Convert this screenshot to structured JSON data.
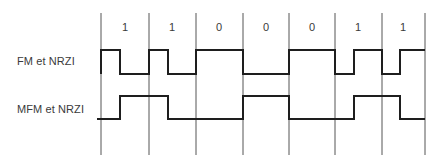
{
  "diagram": {
    "type": "line-coding-timing-diagram",
    "bits": [
      "1",
      "1",
      "0",
      "0",
      "0",
      "1",
      "1"
    ],
    "cell_boundaries_x": [
      101,
      149,
      196,
      243,
      289,
      335,
      382,
      425
    ],
    "signals": [
      {
        "label": "FM et NRZI",
        "high_y": 50,
        "low_y": 74,
        "points": "101,74 101,50 120,50 120,74 149,74 149,50 168,50 168,74 196,74 196,50 243,50 243,74 289,74 289,50 335,50 335,74 354,74 354,50 382,50 382,74 400,74 400,50 425,50"
      },
      {
        "label": "MFM et NRZI",
        "high_y": 96,
        "low_y": 119,
        "points": "97,119 120,119 120,96 168,96 168,119 243,119 243,96 289,96 289,119 354,119 354,96 400,96 400,119 425,119"
      }
    ],
    "colors": {
      "signal": "#1e1e1e",
      "gridline": "#555555",
      "text": "#3a3a3a"
    }
  }
}
